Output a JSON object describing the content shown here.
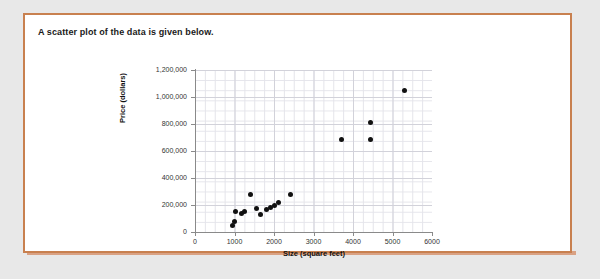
{
  "prompt": "A scatter plot of the data is given below.",
  "colors": {
    "frame": "#c8804f",
    "card_background": "#ffffff",
    "page_background": "#e8e8e8",
    "point": "#111111",
    "grid_minor": "#e4e4ea",
    "grid_major": "#d2d2da",
    "axis": "#8a8a8a"
  },
  "chart_data": {
    "type": "scatter",
    "title": "",
    "xlabel": "Size (square feet)",
    "ylabel": "Price (dollars)",
    "xlim": [
      0,
      6000
    ],
    "ylim": [
      0,
      1200000
    ],
    "xticks": [
      0,
      1000,
      2000,
      3000,
      4000,
      5000,
      6000
    ],
    "xtick_labels": [
      "0",
      "1000",
      "2000",
      "3000",
      "4000",
      "5000",
      "6000"
    ],
    "yticks": [
      0,
      200000,
      400000,
      600000,
      800000,
      1000000,
      1200000
    ],
    "ytick_labels": [
      "0",
      "200,000",
      "400,000",
      "600,000",
      "800,000",
      "1,000,000",
      "1,200,000"
    ],
    "grid": true,
    "legend": false,
    "series_name": "Houses",
    "points": [
      {
        "x": 960,
        "y": 50000
      },
      {
        "x": 990,
        "y": 75000
      },
      {
        "x": 1020,
        "y": 150000
      },
      {
        "x": 1180,
        "y": 140000
      },
      {
        "x": 1260,
        "y": 150000
      },
      {
        "x": 1400,
        "y": 275000
      },
      {
        "x": 1560,
        "y": 175000
      },
      {
        "x": 1660,
        "y": 130000
      },
      {
        "x": 1810,
        "y": 165000
      },
      {
        "x": 1920,
        "y": 180000
      },
      {
        "x": 2020,
        "y": 195000
      },
      {
        "x": 2120,
        "y": 215000
      },
      {
        "x": 2430,
        "y": 275000
      },
      {
        "x": 3700,
        "y": 685000
      },
      {
        "x": 4450,
        "y": 685000
      },
      {
        "x": 4450,
        "y": 810000
      },
      {
        "x": 5300,
        "y": 1045000
      }
    ]
  }
}
